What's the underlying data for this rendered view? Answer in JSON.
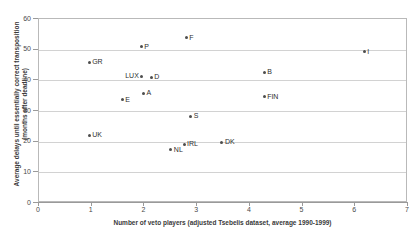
{
  "chart_data": {
    "type": "scatter",
    "title": "",
    "xlabel": "Number of veto players (adjusted Tsebelis dataset, average 1990-1999)",
    "ylabel_line1": "Average delays until essentially correct transposition",
    "ylabel_line2": "(months after deadline)",
    "xlim": [
      0,
      7
    ],
    "ylim": [
      0,
      60
    ],
    "xticks": [
      "0",
      "1",
      "2",
      "3",
      "4",
      "5",
      "6",
      "7"
    ],
    "yticks": [
      "0",
      "10",
      "20",
      "30",
      "40",
      "50",
      "60"
    ],
    "grid": "horizontal",
    "legend": "none",
    "marker_color": "#4d4d4d",
    "gridline_color": "#d2d2d2",
    "axis_color": "#9a9a9a",
    "points": [
      {
        "label": "GR",
        "x": 0.97,
        "y": 45.6,
        "label_side": "right"
      },
      {
        "label": "UK",
        "x": 0.97,
        "y": 21.8,
        "label_side": "right"
      },
      {
        "label": "E",
        "x": 1.6,
        "y": 33.3,
        "label_side": "right"
      },
      {
        "label": "P",
        "x": 1.96,
        "y": 50.6,
        "label_side": "right"
      },
      {
        "label": "LUX",
        "x": 1.97,
        "y": 41.0,
        "label_side": "left"
      },
      {
        "label": "A",
        "x": 2.0,
        "y": 35.5,
        "label_side": "right"
      },
      {
        "label": "D",
        "x": 2.15,
        "y": 40.6,
        "label_side": "right"
      },
      {
        "label": "NL",
        "x": 2.52,
        "y": 17.0,
        "label_side": "right"
      },
      {
        "label": "IRL",
        "x": 2.77,
        "y": 18.9,
        "label_side": "right"
      },
      {
        "label": "F",
        "x": 2.81,
        "y": 53.6,
        "label_side": "right"
      },
      {
        "label": "S",
        "x": 2.9,
        "y": 28.0,
        "label_side": "right"
      },
      {
        "label": "DK",
        "x": 3.49,
        "y": 19.5,
        "label_side": "right"
      },
      {
        "label": "B",
        "x": 4.29,
        "y": 42.3,
        "label_side": "right"
      },
      {
        "label": "FIN",
        "x": 4.29,
        "y": 34.4,
        "label_side": "right"
      },
      {
        "label": "I",
        "x": 6.19,
        "y": 49.0,
        "label_side": "right"
      }
    ]
  }
}
